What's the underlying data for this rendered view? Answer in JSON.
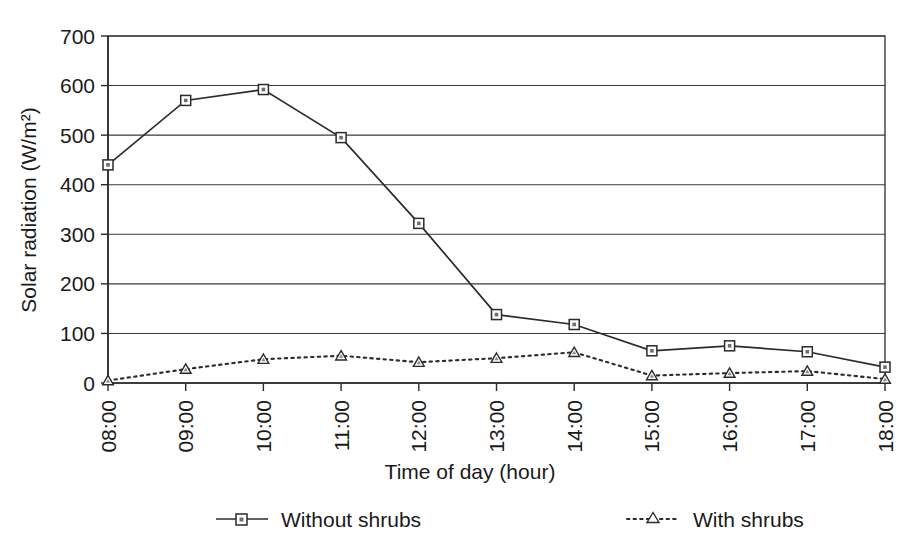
{
  "chart_data": {
    "type": "line",
    "title": "",
    "xlabel": "Time of day (hour)",
    "ylabel": "Solar radiation (W/m²)",
    "categories": [
      "08:00",
      "09:00",
      "10:00",
      "11:00",
      "12:00",
      "13:00",
      "14:00",
      "15:00",
      "16:00",
      "17:00",
      "18:00"
    ],
    "yticks": [
      "0",
      "100",
      "200",
      "300",
      "400",
      "500",
      "600",
      "700"
    ],
    "ylim": [
      0,
      700
    ],
    "grid": true,
    "legend_position": "bottom",
    "series": [
      {
        "name": "Without shrubs",
        "marker": "square",
        "line_style": "solid",
        "color": "#2b2b2b",
        "values": [
          440,
          570,
          592,
          495,
          322,
          138,
          118,
          65,
          75,
          63,
          32
        ]
      },
      {
        "name": "With shrubs",
        "marker": "triangle",
        "line_style": "dotted",
        "color": "#2b2b2b",
        "values": [
          5,
          28,
          48,
          55,
          42,
          50,
          62,
          15,
          20,
          24,
          8
        ]
      }
    ]
  },
  "legend": {
    "items": [
      {
        "label": "Without shrubs",
        "marker": "square-marker-icon",
        "style": "solid"
      },
      {
        "label": "With shrubs",
        "marker": "triangle-marker-icon",
        "style": "dotted"
      }
    ]
  }
}
